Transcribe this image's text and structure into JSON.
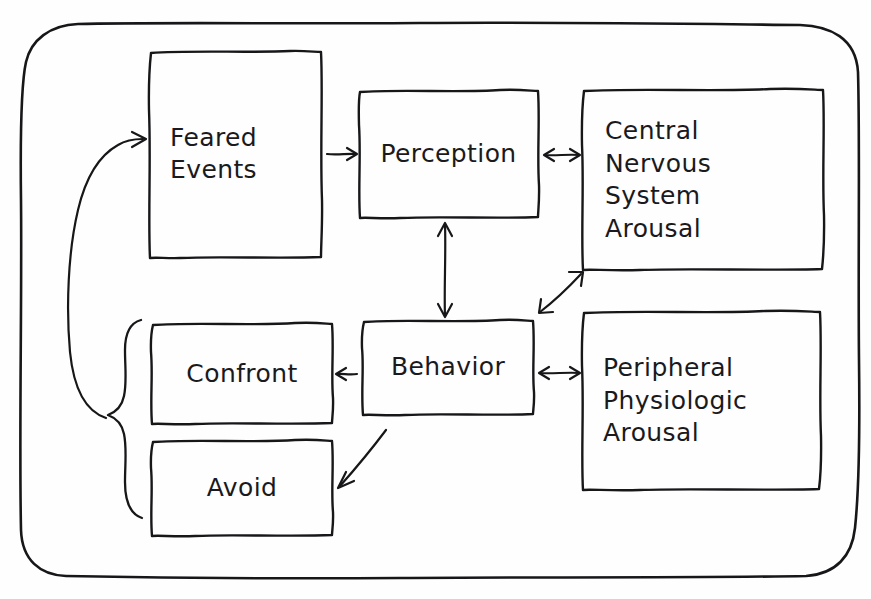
{
  "diagram": {
    "style": "hand-drawn sketch, black ink on white paper",
    "ink_color": "#17171a",
    "paper_color": "#fefefe",
    "nodes": [
      {
        "id": "feared-events",
        "label": "Feared\nEvents",
        "lines": [
          "Feared",
          "Events"
        ],
        "x": 150,
        "y": 51,
        "w": 172,
        "h": 207
      },
      {
        "id": "perception",
        "label": "Perception",
        "lines": [
          "Perception"
        ],
        "x": 359,
        "y": 90,
        "w": 179,
        "h": 128
      },
      {
        "id": "central-nervous-system-arousal",
        "label": "Central\nNervous\nSystem\nArousal",
        "lines": [
          "Central",
          "Nervous",
          "System",
          "Arousal"
        ],
        "x": 583,
        "y": 89,
        "w": 240,
        "h": 181
      },
      {
        "id": "behavior",
        "label": "Behavior",
        "lines": [
          "Behavior"
        ],
        "x": 363,
        "y": 320,
        "w": 170,
        "h": 95
      },
      {
        "id": "confront",
        "label": "Confront",
        "lines": [
          "Confront"
        ],
        "x": 152,
        "y": 323,
        "w": 180,
        "h": 102
      },
      {
        "id": "avoid",
        "label": "Avoid",
        "lines": [
          "Avoid"
        ],
        "x": 152,
        "y": 440,
        "w": 180,
        "h": 97
      },
      {
        "id": "peripheral-physiologic-arousal",
        "label": "Peripheral\nPhysiologic\nArousal",
        "lines": [
          "Peripheral",
          "Physiologic",
          "Arousal"
        ],
        "x": 583,
        "y": 311,
        "w": 237,
        "h": 179
      }
    ],
    "connectors": [
      {
        "id": "feared-events-to-perception",
        "from": "feared-events",
        "to": "perception",
        "kind": "arrow",
        "direction": "one-way"
      },
      {
        "id": "perception-to-cns-arousal",
        "from": "perception",
        "to": "central-nervous-system-arousal",
        "kind": "arrow",
        "direction": "two-way"
      },
      {
        "id": "perception-to-behavior",
        "from": "perception",
        "to": "behavior",
        "kind": "arrow",
        "direction": "two-way"
      },
      {
        "id": "behavior-to-cns-arousal",
        "from": "behavior",
        "to": "central-nervous-system-arousal",
        "kind": "arrow",
        "direction": "two-way"
      },
      {
        "id": "behavior-to-peripheral-arousal",
        "from": "behavior",
        "to": "peripheral-physiologic-arousal",
        "kind": "arrow",
        "direction": "two-way"
      },
      {
        "id": "behavior-to-confront",
        "from": "behavior",
        "to": "confront",
        "kind": "arrow",
        "direction": "one-way"
      },
      {
        "id": "behavior-to-avoid",
        "from": "behavior",
        "to": "avoid",
        "kind": "arrow",
        "direction": "one-way"
      },
      {
        "id": "confront-avoid-brace",
        "from": "confront",
        "to": "avoid",
        "kind": "brace",
        "direction": "group"
      },
      {
        "id": "brace-to-feared-events",
        "from": "confront-avoid-brace",
        "to": "feared-events",
        "kind": "curved-arrow",
        "direction": "one-way"
      }
    ],
    "outer_frame": {
      "x": 20,
      "y": 22,
      "w": 840,
      "h": 555,
      "radius": 58
    }
  }
}
